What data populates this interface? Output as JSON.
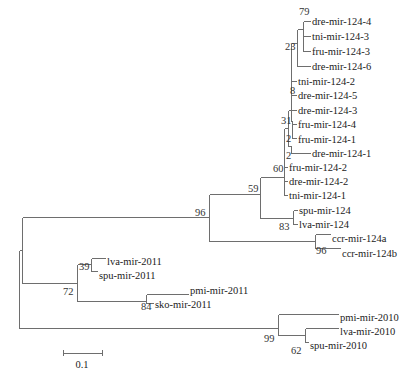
{
  "diagram": {
    "type": "phylogenetic-tree",
    "scale_bar": {
      "label": "0.1",
      "x1": 63,
      "x2": 102,
      "y": 353,
      "label_x": 82,
      "label_y": 368
    },
    "leaves": [
      {
        "name": "dre-mir-124-4",
        "x": 312,
        "y": 21
      },
      {
        "name": "tni-mir-124-3",
        "x": 312,
        "y": 36
      },
      {
        "name": "fru-mir-124-3",
        "x": 312,
        "y": 51
      },
      {
        "name": "dre-mir-124-6",
        "x": 312,
        "y": 66
      },
      {
        "name": "tni-mir-124-2",
        "x": 298,
        "y": 81
      },
      {
        "name": "dre-mir-124-5",
        "x": 298,
        "y": 95
      },
      {
        "name": "dre-mir-124-3",
        "x": 298,
        "y": 110
      },
      {
        "name": "fru-mir-124-4",
        "x": 298,
        "y": 124
      },
      {
        "name": "fru-mir-124-1",
        "x": 298,
        "y": 139
      },
      {
        "name": "dre-mir-124-1",
        "x": 312,
        "y": 153
      },
      {
        "name": "fru-mir-124-2",
        "x": 289,
        "y": 167
      },
      {
        "name": "dre-mir-124-2",
        "x": 289,
        "y": 181
      },
      {
        "name": "tni-mir-124-1",
        "x": 289,
        "y": 195
      },
      {
        "name": "spu-mir-124",
        "x": 299,
        "y": 210
      },
      {
        "name": "lva-mir-124",
        "x": 299,
        "y": 224
      },
      {
        "name": "ccr-mir-124a",
        "x": 332,
        "y": 238
      },
      {
        "name": "ccr-mir-124b",
        "x": 342,
        "y": 253
      },
      {
        "name": "lva-mir-2011",
        "x": 107,
        "y": 261
      },
      {
        "name": "spu-mir-2011",
        "x": 99,
        "y": 275
      },
      {
        "name": "pmi-mir-2011",
        "x": 190,
        "y": 290
      },
      {
        "name": "sko-mir-2011",
        "x": 155,
        "y": 304
      },
      {
        "name": "pmi-mir-2010",
        "x": 340,
        "y": 317
      },
      {
        "name": "lva-mir-2010",
        "x": 340,
        "y": 331
      },
      {
        "name": "spu-mir-2010",
        "x": 310,
        "y": 345
      }
    ],
    "bootstrap": [
      {
        "value": "79",
        "x": 299,
        "y": 11
      },
      {
        "value": "23",
        "x": 285,
        "y": 46
      },
      {
        "value": "8",
        "x": 290,
        "y": 90
      },
      {
        "value": "31",
        "x": 281,
        "y": 120
      },
      {
        "value": "2",
        "x": 286,
        "y": 138
      },
      {
        "value": "2",
        "x": 286,
        "y": 155
      },
      {
        "value": "60",
        "x": 273,
        "y": 168
      },
      {
        "value": "59",
        "x": 248,
        "y": 188
      },
      {
        "value": "96",
        "x": 195,
        "y": 212
      },
      {
        "value": "83",
        "x": 279,
        "y": 226
      },
      {
        "value": "96",
        "x": 316,
        "y": 250
      },
      {
        "value": "39",
        "x": 79,
        "y": 266
      },
      {
        "value": "72",
        "x": 63,
        "y": 291
      },
      {
        "value": "84",
        "x": 141,
        "y": 306
      },
      {
        "value": "99",
        "x": 264,
        "y": 338
      },
      {
        "value": "62",
        "x": 291,
        "y": 350
      }
    ],
    "branches": [
      [
        19,
        250,
        19,
        328
      ],
      [
        19,
        250,
        22,
        250
      ],
      [
        19,
        328,
        22,
        328
      ],
      [
        22,
        217,
        22,
        283
      ],
      [
        22,
        217,
        209,
        217
      ],
      [
        22,
        283,
        77,
        283
      ],
      [
        209,
        194,
        209,
        241
      ],
      [
        209,
        194,
        260,
        194
      ],
      [
        209,
        241,
        315,
        241
      ],
      [
        260,
        177,
        260,
        218
      ],
      [
        260,
        177,
        284,
        177
      ],
      [
        260,
        218,
        293,
        218
      ],
      [
        293,
        210,
        293,
        224
      ],
      [
        293,
        210,
        297,
        210
      ],
      [
        293,
        224,
        297,
        224
      ],
      [
        315,
        234,
        315,
        248
      ],
      [
        315,
        234,
        330,
        234
      ],
      [
        315,
        248,
        340,
        248
      ],
      [
        284,
        128,
        284,
        195
      ],
      [
        284,
        128,
        288,
        128
      ],
      [
        284,
        167,
        287,
        167
      ],
      [
        284,
        181,
        287,
        181
      ],
      [
        284,
        195,
        287,
        195
      ],
      [
        288,
        110,
        288,
        146
      ],
      [
        288,
        110,
        291,
        110
      ],
      [
        288,
        146,
        291,
        146
      ],
      [
        291,
        43,
        291,
        121
      ],
      [
        291,
        43,
        297,
        43
      ],
      [
        291,
        81,
        296,
        81
      ],
      [
        291,
        95,
        296,
        95
      ],
      [
        291,
        110,
        296,
        110
      ],
      [
        291,
        121,
        292,
        121
      ],
      [
        292,
        121,
        292,
        138
      ],
      [
        292,
        124,
        296,
        124
      ],
      [
        292,
        138,
        296,
        138
      ],
      [
        291,
        146,
        291,
        153
      ],
      [
        291,
        153,
        310,
        153
      ],
      [
        297,
        29,
        297,
        66
      ],
      [
        297,
        29,
        303,
        29
      ],
      [
        297,
        66,
        310,
        66
      ],
      [
        303,
        21,
        303,
        51
      ],
      [
        303,
        21,
        310,
        21
      ],
      [
        303,
        36,
        310,
        36
      ],
      [
        303,
        51,
        310,
        51
      ],
      [
        77,
        264,
        77,
        301
      ],
      [
        77,
        264,
        91,
        264
      ],
      [
        77,
        301,
        146,
        301
      ],
      [
        91,
        258,
        91,
        271
      ],
      [
        91,
        258,
        105,
        258
      ],
      [
        91,
        271,
        97,
        271
      ],
      [
        146,
        294,
        146,
        303
      ],
      [
        146,
        294,
        188,
        294
      ],
      [
        146,
        303,
        153,
        303
      ],
      [
        22,
        328,
        278,
        328
      ],
      [
        278,
        314,
        278,
        335
      ],
      [
        278,
        314,
        338,
        314
      ],
      [
        278,
        335,
        305,
        335
      ],
      [
        305,
        328,
        305,
        342
      ],
      [
        305,
        328,
        338,
        328
      ],
      [
        305,
        342,
        308,
        342
      ]
    ]
  }
}
